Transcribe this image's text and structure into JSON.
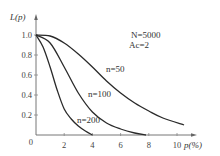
{
  "chart_data": {
    "type": "line",
    "title": "",
    "xlabel": "p(%)",
    "ylabel": "L(p)",
    "xlim": [
      0,
      11
    ],
    "ylim": [
      0,
      1.0
    ],
    "grid": false,
    "legend_position": "inline-labels",
    "x_ticks": [
      "0",
      "2",
      "4",
      "6",
      "8",
      "10"
    ],
    "y_ticks": [
      "0",
      "0.2",
      "0.4",
      "0.6",
      "0.8",
      "1.0"
    ],
    "annotations": [
      "N=5000",
      "Ac=2"
    ],
    "series": [
      {
        "name": "n=50",
        "label": "n=50",
        "x": [
          0,
          1,
          2,
          3,
          4,
          5,
          6,
          7,
          8,
          9,
          10.5
        ],
        "y": [
          1.0,
          0.99,
          0.92,
          0.81,
          0.68,
          0.54,
          0.42,
          0.32,
          0.24,
          0.17,
          0.1
        ]
      },
      {
        "name": "n=100",
        "label": "n=100",
        "x": [
          0,
          1,
          2,
          3,
          4,
          5,
          6,
          7,
          7.8
        ],
        "y": [
          1.0,
          0.92,
          0.68,
          0.42,
          0.23,
          0.12,
          0.06,
          0.02,
          0.0
        ]
      },
      {
        "name": "n=200",
        "label": "n=200",
        "x": [
          0,
          0.5,
          1,
          1.5,
          2,
          2.5,
          3,
          3.5,
          4
        ],
        "y": [
          1.0,
          0.88,
          0.68,
          0.45,
          0.26,
          0.16,
          0.09,
          0.04,
          0.0
        ]
      }
    ]
  },
  "labels": {
    "ylabel": "L(p)",
    "xlabel": "p(%)",
    "annot_n": "N=5000",
    "annot_ac": "Ac=2",
    "series_50": "n=50",
    "series_100": "n=100",
    "series_200": "n=200",
    "origin": "0"
  }
}
